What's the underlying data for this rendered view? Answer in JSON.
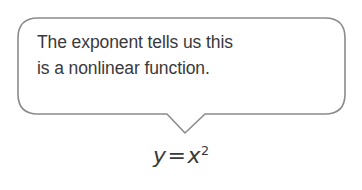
{
  "figure": {
    "type": "annotated-equation-callout",
    "background_color": "#ffffff",
    "callout": {
      "shape": "rounded-rectangle-speech-bubble",
      "tail_direction": "down",
      "border_color": "#8b8b8b",
      "fill_color": "#ffffff",
      "text": "The exponent tells us this\nis a nonlinear function.",
      "text_lines": [
        "The exponent tells us this",
        "is a nonlinear function."
      ],
      "text_color": "#39393b"
    },
    "equation": {
      "left_side": "y",
      "operator": "=",
      "base": "x",
      "exponent": "2",
      "plain_text": "y = x²",
      "text_color": "#39393b"
    }
  }
}
